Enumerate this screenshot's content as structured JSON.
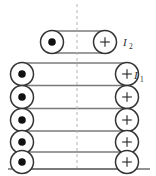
{
  "figure": {
    "type": "physics-diagram",
    "background_color": "#ffffff",
    "width": 156,
    "height": 176,
    "symmetry_axis": {
      "name": "axis-of-symmetry",
      "style": "dashed",
      "orientation": "vertical",
      "x": 77,
      "y_start": 4,
      "y_end": 172,
      "color": "#b4b4b4"
    },
    "ground_line": {
      "name": "baseline",
      "x_start": 8,
      "x_end": 150,
      "y": 169,
      "color": "#6f6f6f"
    },
    "colors": {
      "wire_stroke": "#7a7a7a",
      "circle_stroke": "#333333",
      "dot_fill": "#111111",
      "dashed_axis": "#b4b4b4",
      "label_text": "#2b2b2b",
      "circle_fill": "#ffffff"
    },
    "coils": [
      {
        "id": "upper-coil",
        "label": "I",
        "label_subscript": "2",
        "label_full": "I2",
        "label_x": 123,
        "label_y": 46,
        "turns": 1,
        "left_markers": [
          {
            "symbol": "dot",
            "meaning": "current out of page",
            "cx": 52,
            "cy": 42,
            "r": 11.5
          }
        ],
        "right_markers": [
          {
            "symbol": "plus",
            "meaning": "current into page",
            "cx": 105,
            "cy": 42,
            "r": 11.5
          }
        ],
        "wires": [
          {
            "x1": 52,
            "y1": 31,
            "x2": 105,
            "y2": 31
          },
          {
            "x1": 52,
            "y1": 53,
            "x2": 105,
            "y2": 53
          }
        ]
      },
      {
        "id": "lower-coil",
        "label": "I",
        "label_subscript": "1",
        "label_full": "I1",
        "label_x": 134,
        "label_y": 79,
        "turns": 5,
        "left_markers": [
          {
            "symbol": "dot",
            "meaning": "current out of page",
            "cx": 22,
            "cy": 74,
            "r": 11.5
          },
          {
            "symbol": "dot",
            "meaning": "current out of page",
            "cx": 22,
            "cy": 97,
            "r": 11.5
          },
          {
            "symbol": "dot",
            "meaning": "current out of page",
            "cx": 22,
            "cy": 120,
            "r": 11.5
          },
          {
            "symbol": "dot",
            "meaning": "current out of page",
            "cx": 22,
            "cy": 142,
            "r": 11.5
          },
          {
            "symbol": "dot",
            "meaning": "current out of page",
            "cx": 22,
            "cy": 162,
            "r": 11.5
          }
        ],
        "right_markers": [
          {
            "symbol": "plus",
            "meaning": "current into page",
            "cx": 127,
            "cy": 74,
            "r": 11.5
          },
          {
            "symbol": "plus",
            "meaning": "current into page",
            "cx": 127,
            "cy": 97,
            "r": 11.5
          },
          {
            "symbol": "plus",
            "meaning": "current into page",
            "cx": 127,
            "cy": 120,
            "r": 11.5
          },
          {
            "symbol": "plus",
            "meaning": "current into page",
            "cx": 127,
            "cy": 142,
            "r": 11.5
          },
          {
            "symbol": "plus",
            "meaning": "current into page",
            "cx": 127,
            "cy": 162,
            "r": 11.5
          }
        ],
        "wires": [
          {
            "x1": 22,
            "y1": 63,
            "x2": 127,
            "y2": 63
          },
          {
            "x1": 22,
            "y1": 85.5,
            "x2": 127,
            "y2": 85.5
          },
          {
            "x1": 22,
            "y1": 108.5,
            "x2": 127,
            "y2": 108.5
          },
          {
            "x1": 22,
            "y1": 131,
            "x2": 127,
            "y2": 131
          },
          {
            "x1": 22,
            "y1": 152,
            "x2": 127,
            "y2": 152
          },
          {
            "x1": 22,
            "y1": 169,
            "x2": 127,
            "y2": 169
          }
        ]
      }
    ]
  }
}
